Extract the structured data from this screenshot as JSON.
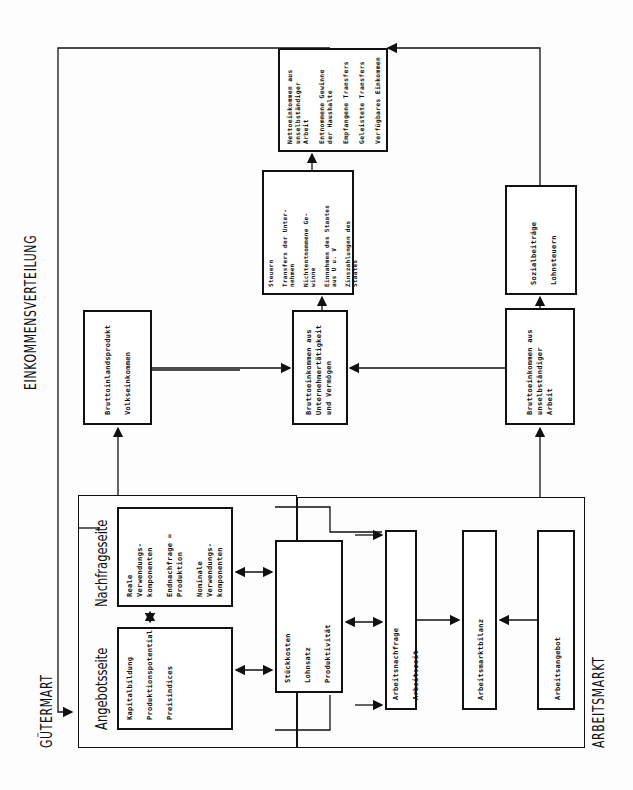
{
  "sections": {
    "gutermarkt": "GÜTERMART",
    "einkommensverteilung": "EINKOMMENSVERTEILUNG",
    "arbeitsmarkt": "ARBEITSMARKT"
  },
  "gutermarkt": {
    "angebotsseite": {
      "title": "Angebotsseite",
      "items": "Kapitalbildung\n\nProduktionspotential\n\nPreisindices"
    },
    "nachfrageseite": {
      "title": "Nachfrageseite",
      "items": "Reale Verwendungs-\nkomponenten\n\nEndnachfrage =\nProduktion\n\nNominale\nVerwendungs-\nkomponenten"
    }
  },
  "stueckkosten": {
    "items": "Stückkosten\n\nLohnsatz\n\nProduktivität"
  },
  "arbeitsmarkt": {
    "nachfrage": {
      "items": "Arbeitsnachfrage\n\nArbeitszeit"
    },
    "bilanz": {
      "items": "Arbeitsmarktbilanz"
    },
    "angebot": {
      "items": "Arbeitsangebot"
    }
  },
  "einkommen": {
    "bip": {
      "items": "Bruttoinlandsprodukt\n\nVolkseinkommen"
    },
    "unternehmer": {
      "items": "Bruttoeinkommen aus\nUnternehmertätigkeit\nund Vermögen"
    },
    "unselbstaendig": {
      "items": "Bruttoeinkommen aus\nunselbständiger\nArbeit"
    },
    "steuern": {
      "items": "Steuern\n\nTransfers der Unter-\nnehmen\n\nNichtentnommene Ge-\nwinne\n\nEinnahmen des Staates\naus U u. V\n\nZinszahlungen des\nStaates"
    },
    "sozial": {
      "items": "Sozialbeiträge\n\nLohnsteuern"
    },
    "haushalte": {
      "items": "Nettoeinkommen aus\nunselbständiger\nArbeit\n\nEntnommene Gewinne\nder Haushalte\n\nEmpfangene Transfers\n\nGeleistete Transfers\n\nVerfügbares Einkommen"
    }
  }
}
